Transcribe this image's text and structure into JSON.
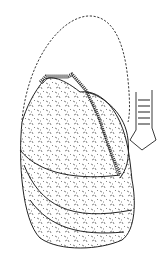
{
  "figure": {
    "type": "scientific-line-drawing",
    "background": "#ffffff",
    "ink": "#1a1a1a",
    "parts": [
      {
        "name": "dashed-outline",
        "style": "dashed"
      },
      {
        "name": "upper-lobe",
        "style": "stippled"
      },
      {
        "name": "lower-lobe",
        "style": "stippled"
      },
      {
        "name": "bottom-band",
        "style": "stippled"
      },
      {
        "name": "ridge-band",
        "style": "hatched"
      },
      {
        "name": "tube-structure",
        "style": "ringed"
      }
    ]
  }
}
